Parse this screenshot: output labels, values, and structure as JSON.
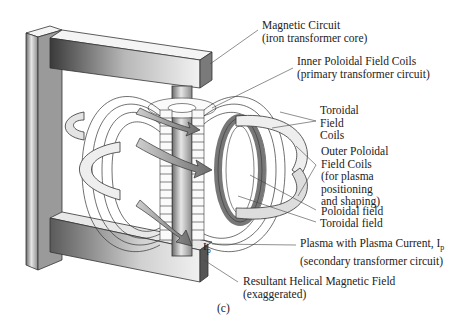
{
  "figure": {
    "caption": "(c)",
    "labels": {
      "magnetic_circuit": {
        "line1": "Magnetic Circuit",
        "line2": "(iron transformer core)"
      },
      "inner_poloidal": {
        "line1": "Inner Poloidal Field Coils",
        "line2": "(primary transformer circuit)"
      },
      "toroidal_coils": {
        "line1": "Toroidal",
        "line2": "Field",
        "line3": "Coils"
      },
      "outer_poloidal": {
        "line1": "Outer Poloidal",
        "line2": "Field Coils",
        "line3": "(for plasma",
        "line4": "positioning",
        "line5": "and shaping)"
      },
      "poloidal_field": {
        "line1": "Poloidal field"
      },
      "toroidal_field": {
        "line1": "Toroidal field"
      },
      "plasma": {
        "line1": "Plasma with Plasma Current, I",
        "line1_sub": "p",
        "line2": "(secondary transformer circuit)"
      },
      "helical": {
        "line1": "Resultant Helical Magnetic Field",
        "line2": "(exaggerated)"
      }
    },
    "inline_symbol": {
      "text": "I",
      "sub": "p"
    }
  }
}
